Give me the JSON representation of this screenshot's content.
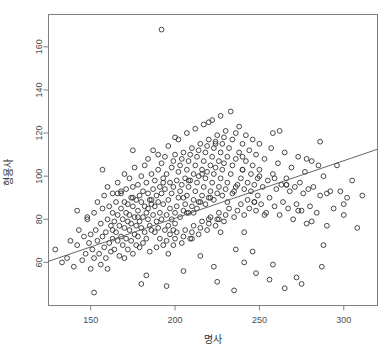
{
  "chart_data": {
    "type": "scatter",
    "title": "",
    "xlabel": "명사",
    "ylabel": "형용사",
    "xlim": [
      125,
      320
    ],
    "ylim": [
      40,
      175
    ],
    "xticks": [
      150,
      200,
      250,
      300
    ],
    "yticks": [
      60,
      80,
      100,
      120,
      140,
      160
    ],
    "grid": false,
    "legend": null,
    "point_style": {
      "marker": "open-circle",
      "radius": 2.4,
      "color": "#333333"
    },
    "trendline": {
      "type": "linear",
      "x": [
        125,
        320
      ],
      "y": [
        60.5,
        112.5
      ],
      "color": "#555555"
    },
    "x": [
      129,
      133,
      136,
      138,
      140,
      142,
      143,
      145,
      146,
      147,
      148,
      149,
      150,
      150,
      151,
      152,
      152,
      153,
      154,
      154,
      155,
      156,
      156,
      157,
      157,
      158,
      158,
      159,
      159,
      160,
      160,
      161,
      161,
      162,
      162,
      163,
      163,
      163,
      164,
      164,
      165,
      165,
      166,
      166,
      166,
      167,
      167,
      168,
      168,
      168,
      169,
      169,
      170,
      170,
      170,
      171,
      171,
      171,
      172,
      172,
      172,
      173,
      173,
      173,
      174,
      174,
      174,
      175,
      175,
      175,
      176,
      176,
      176,
      177,
      177,
      177,
      178,
      178,
      178,
      179,
      179,
      179,
      180,
      180,
      180,
      181,
      181,
      181,
      182,
      182,
      182,
      183,
      183,
      183,
      184,
      184,
      184,
      185,
      185,
      185,
      186,
      186,
      186,
      187,
      187,
      187,
      188,
      188,
      188,
      189,
      189,
      189,
      190,
      190,
      190,
      191,
      191,
      191,
      192,
      192,
      192,
      193,
      193,
      193,
      194,
      194,
      194,
      195,
      195,
      195,
      196,
      196,
      196,
      197,
      197,
      197,
      198,
      198,
      198,
      199,
      199,
      199,
      200,
      200,
      200,
      201,
      201,
      201,
      202,
      202,
      202,
      203,
      203,
      203,
      204,
      204,
      204,
      205,
      205,
      205,
      206,
      206,
      206,
      207,
      207,
      207,
      208,
      208,
      208,
      209,
      209,
      209,
      210,
      210,
      210,
      211,
      211,
      211,
      212,
      212,
      212,
      213,
      213,
      213,
      214,
      214,
      214,
      215,
      215,
      215,
      216,
      216,
      216,
      217,
      217,
      217,
      218,
      218,
      218,
      219,
      219,
      219,
      220,
      220,
      220,
      221,
      221,
      221,
      222,
      222,
      222,
      223,
      223,
      223,
      224,
      224,
      224,
      225,
      225,
      225,
      226,
      226,
      226,
      227,
      227,
      227,
      228,
      228,
      228,
      229,
      229,
      229,
      230,
      230,
      230,
      231,
      231,
      232,
      232,
      233,
      233,
      234,
      234,
      235,
      235,
      236,
      236,
      237,
      237,
      238,
      238,
      239,
      239,
      240,
      240,
      241,
      241,
      242,
      242,
      243,
      243,
      244,
      244,
      245,
      245,
      246,
      246,
      247,
      247,
      248,
      248,
      249,
      249,
      250,
      250,
      251,
      252,
      253,
      254,
      255,
      256,
      257,
      258,
      259,
      260,
      261,
      262,
      263,
      264,
      265,
      266,
      267,
      268,
      269,
      270,
      271,
      272,
      273,
      274,
      275,
      276,
      277,
      278,
      279,
      280,
      281,
      282,
      284,
      286,
      288,
      290,
      292,
      294,
      296,
      298,
      300,
      302,
      305,
      308,
      311,
      142,
      157,
      168,
      178,
      186,
      193,
      199,
      205,
      211,
      216,
      221,
      226,
      231,
      236,
      241,
      247,
      253,
      259,
      266,
      273,
      281,
      290,
      300,
      148,
      163,
      175,
      184,
      192,
      200,
      207,
      214,
      220,
      227,
      234,
      241,
      248,
      256,
      265,
      275,
      287,
      152,
      170,
      183,
      195,
      205,
      215,
      225,
      235,
      246,
      258,
      272,
      288,
      160,
      180,
      196,
      210,
      223,
      236,
      250,
      266,
      285,
      166,
      190,
      208,
      224,
      240,
      258,
      278,
      175,
      200,
      220,
      240,
      262,
      286
    ],
    "y": [
      66,
      60,
      62,
      70,
      58,
      68,
      75,
      61,
      72,
      64,
      80,
      69,
      57,
      73,
      66,
      83,
      62,
      75,
      70,
      88,
      64,
      78,
      59,
      72,
      85,
      67,
      91,
      74,
      62,
      80,
      95,
      69,
      86,
      77,
      65,
      83,
      92,
      71,
      79,
      66,
      88,
      74,
      82,
      70,
      97,
      77,
      63,
      85,
      93,
      72,
      80,
      68,
      88,
      76,
      101,
      83,
      71,
      94,
      79,
      66,
      87,
      75,
      99,
      82,
      90,
      70,
      78,
      86,
      64,
      95,
      81,
      73,
      104,
      89,
      77,
      68,
      96,
      84,
      72,
      91,
      79,
      67,
      100,
      88,
      76,
      93,
      81,
      69,
      105,
      86,
      74,
      97,
      83,
      71,
      92,
      80,
      108,
      89,
      77,
      65,
      101,
      87,
      75,
      94,
      82,
      112,
      98,
      86,
      74,
      91,
      79,
      67,
      103,
      88,
      76,
      95,
      83,
      71,
      106,
      92,
      80,
      68,
      99,
      87,
      75,
      109,
      94,
      82,
      70,
      101,
      89,
      77,
      114,
      97,
      85,
      73,
      104,
      92,
      80,
      68,
      107,
      95,
      83,
      71,
      110,
      98,
      86,
      74,
      102,
      90,
      117,
      105,
      93,
      81,
      69,
      108,
      96,
      84,
      72,
      111,
      99,
      87,
      75,
      103,
      91,
      120,
      107,
      95,
      83,
      71,
      110,
      98,
      86,
      74,
      113,
      101,
      89,
      77,
      105,
      93,
      122,
      109,
      97,
      85,
      73,
      112,
      100,
      88,
      76,
      115,
      103,
      91,
      79,
      107,
      95,
      124,
      111,
      99,
      87,
      75,
      114,
      102,
      90,
      78,
      117,
      105,
      93,
      81,
      109,
      97,
      126,
      113,
      101,
      89,
      77,
      116,
      104,
      92,
      80,
      119,
      107,
      95,
      83,
      111,
      99,
      128,
      115,
      103,
      91,
      79,
      118,
      106,
      94,
      82,
      121,
      109,
      97,
      85,
      113,
      101,
      130,
      117,
      105,
      93,
      81,
      120,
      108,
      96,
      84,
      123,
      111,
      99,
      87,
      115,
      103,
      94,
      82,
      119,
      107,
      89,
      97,
      112,
      85,
      101,
      93,
      117,
      105,
      88,
      96,
      110,
      84,
      99,
      91,
      115,
      103,
      87,
      95,
      108,
      83,
      98,
      90,
      113,
      101,
      86,
      94,
      106,
      82,
      96,
      88,
      111,
      99,
      85,
      93,
      104,
      80,
      95,
      87,
      109,
      97,
      84,
      92,
      102,
      78,
      94,
      86,
      107,
      95,
      83,
      91,
      100,
      77,
      93,
      85,
      105,
      93,
      82,
      90,
      98,
      76,
      91,
      84,
      103,
      92,
      81,
      89,
      97,
      75,
      90,
      83,
      101,
      90,
      80,
      88,
      95,
      74,
      88,
      82,
      99,
      96,
      84,
      79,
      92,
      87,
      81,
      75,
      90,
      85,
      168,
      78,
      83,
      88,
      80,
      74,
      92,
      60,
      55,
      52,
      48,
      50,
      58,
      46,
      62,
      54,
      49,
      56,
      63,
      51,
      47,
      65,
      59,
      53,
      68,
      57,
      50,
      64,
      71,
      58,
      66,
      100,
      96,
      105,
      92,
      110,
      98,
      115,
      103,
      120,
      108,
      112,
      118,
      125,
      109,
      121,
      116,
      128,
      122,
      110,
      118,
      126,
      114,
      130,
      75,
      82,
      70,
      88,
      78,
      85,
      92,
      80,
      76,
      88,
      95,
      84,
      79,
      90,
      97,
      86,
      124,
      136,
      118,
      130,
      142,
      126,
      119,
      133,
      140,
      128,
      135,
      146,
      72,
      68,
      74,
      66,
      78,
      70,
      64,
      76,
      72
    ]
  },
  "axis_labels": {
    "x_title": "명사",
    "y_title": "형용사"
  }
}
